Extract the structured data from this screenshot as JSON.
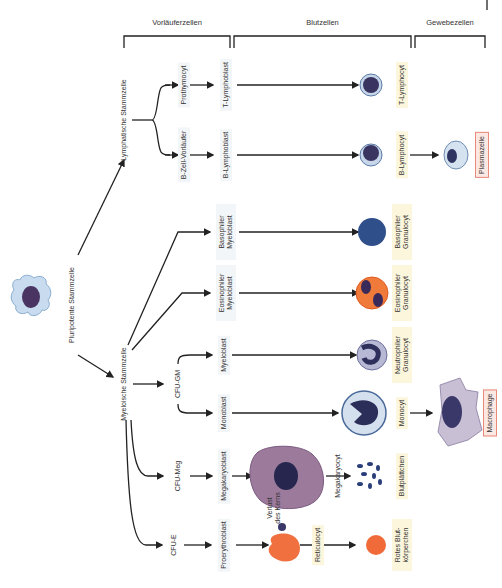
{
  "headers": {
    "precursor": "Vorläuferzellen",
    "blood": "Blutzellen",
    "tissue": "Gewebezellen"
  },
  "stem": {
    "pluripotent": "Pluripotente Stammzelle",
    "lymphatic": "Lymphatische Stammzelle",
    "myeloid": "Myeloische Stammzelle"
  },
  "progenitors": {
    "cfu_gm": "CFU-GM",
    "cfu_meg": "CFU-Meg",
    "cfu_e": "CFU-E"
  },
  "precursors": {
    "prothymocyt": "Prothymocyt",
    "b_zell_vorlaeufer": "B-Zell-Vorläufer",
    "t_lymphoblast": "T-Lymphoblast",
    "b_lymphoblast": "B-Lymphoblast",
    "basophil_myeloblast": "Basophiler Myeloblast",
    "eosinophil_myeloblast": "Eosinophiler Myeloblast",
    "myeloblast": "Myeloblast",
    "monoblast": "Monoblast",
    "megakaryoblast": "Megakaryoblast",
    "proerythroblast": "Proerythroblast"
  },
  "intermediate": {
    "megakaryocyt": "Megakaryocyt",
    "verlust": "Verlust des Kerns",
    "reticulocyt": "Reticulocyt"
  },
  "blood_cells": {
    "t_lymphocyt": "T-Lymphocyt",
    "b_lymphocyt": "B-Lymphocyt",
    "basophil": "Basophiler Granulocyt",
    "eosinophil": "Eosinophiler Granulocyt",
    "neutrophil": "Neutrophiler Granulocyt",
    "monocyt": "Monocyt",
    "blutplaettchen": "Blutplättchen",
    "erythrocyt": "Rotes Blut-körperchen"
  },
  "tissue_cells": {
    "plasmazelle": "Plasmazelle",
    "macrophage": "Macrophage"
  },
  "colors": {
    "precursor_box": "#f3f6f8",
    "blood_box": "#fbf6dc",
    "tissue_box": "#fbe8e2",
    "tissue_border": "#e88a7a",
    "line": "#222222"
  }
}
